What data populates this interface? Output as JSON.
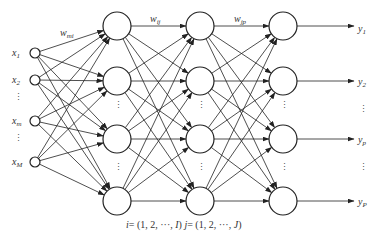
{
  "diagram": {
    "type": "feedforward-neural-network",
    "layers": [
      {
        "name": "input",
        "nodes": [
          "x_1",
          "x_2",
          "x_m",
          "x_M"
        ]
      },
      {
        "name": "hidden-1",
        "nodes": [
          "node_1",
          "node_2",
          "node_i",
          "node_I"
        ]
      },
      {
        "name": "hidden-2",
        "nodes": [
          "node_1",
          "node_2",
          "node_j",
          "node_J"
        ]
      },
      {
        "name": "output",
        "nodes": [
          "y_1",
          "y_2",
          "y_p",
          "y_P"
        ]
      }
    ],
    "inputs": [
      {
        "base": "x",
        "sub": "1"
      },
      {
        "base": "x",
        "sub": "2"
      },
      {
        "base": "x",
        "sub": "m"
      },
      {
        "base": "x",
        "sub": "M"
      }
    ],
    "outputs": [
      {
        "base": "y",
        "sub": "1"
      },
      {
        "base": "y",
        "sub": "2"
      },
      {
        "base": "y",
        "sub": "p"
      },
      {
        "base": "y",
        "sub": "P"
      }
    ],
    "weights": [
      {
        "base": "w",
        "sub": "mi"
      },
      {
        "base": "w",
        "sub": "ij"
      },
      {
        "base": "w",
        "sub": "jp"
      }
    ],
    "ellipsis": "⋮",
    "caption": {
      "i_var": "i",
      "i_range": "= (1, 2, ···, ",
      "i_end": "I",
      "j_var": "j",
      "j_range": "= (1, 2, ···, ",
      "j_end": "J",
      "close": ")"
    },
    "colors": {
      "stroke": "#222222",
      "text": "#333333",
      "background": "#ffffff"
    }
  }
}
